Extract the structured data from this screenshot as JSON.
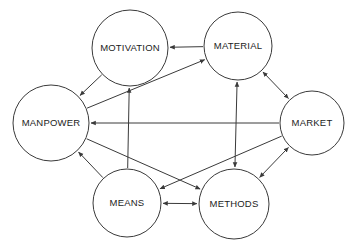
{
  "diagram": {
    "background_color": "#ffffff",
    "stroke_color": "#3a3a3a",
    "text_color": "#1c1c1c",
    "nodes": [
      {
        "id": "motivation",
        "label": "MOTIVATION",
        "cx": 130,
        "cy": 48,
        "r": 38
      },
      {
        "id": "material",
        "label": "MATERIAL",
        "cx": 238,
        "cy": 46,
        "r": 34
      },
      {
        "id": "manpower",
        "label": "MANPOWER",
        "cx": 51,
        "cy": 123,
        "r": 38
      },
      {
        "id": "market",
        "label": "MARKET",
        "cx": 312,
        "cy": 123,
        "r": 32
      },
      {
        "id": "means",
        "label": "MEANS",
        "cx": 127,
        "cy": 203,
        "r": 34
      },
      {
        "id": "methods",
        "label": "METHODS",
        "cx": 234,
        "cy": 204,
        "r": 35
      }
    ],
    "edges": [
      {
        "id": "material-to-motivation",
        "from": "material",
        "to": "motivation",
        "direction": "one-way"
      },
      {
        "id": "motivation-to-manpower",
        "from": "motivation",
        "to": "manpower",
        "direction": "one-way"
      },
      {
        "id": "manpower-to-material",
        "from": "manpower",
        "to": "material",
        "direction": "one-way"
      },
      {
        "id": "means-to-motivation",
        "from": "means",
        "to": "motivation",
        "direction": "one-way"
      },
      {
        "id": "means-to-manpower",
        "from": "means",
        "to": "manpower",
        "direction": "one-way"
      },
      {
        "id": "market-to-manpower",
        "from": "market",
        "to": "manpower",
        "direction": "one-way"
      },
      {
        "id": "market-to-means",
        "from": "market",
        "to": "means",
        "direction": "one-way"
      },
      {
        "id": "manpower-to-methods",
        "from": "manpower",
        "to": "methods",
        "direction": "one-way"
      },
      {
        "id": "material-market",
        "from": "material",
        "to": "market",
        "direction": "two-way"
      },
      {
        "id": "material-methods",
        "from": "material",
        "to": "methods",
        "direction": "two-way"
      },
      {
        "id": "methods-market",
        "from": "methods",
        "to": "market",
        "direction": "two-way"
      },
      {
        "id": "means-methods",
        "from": "means",
        "to": "methods",
        "direction": "two-way"
      }
    ]
  }
}
